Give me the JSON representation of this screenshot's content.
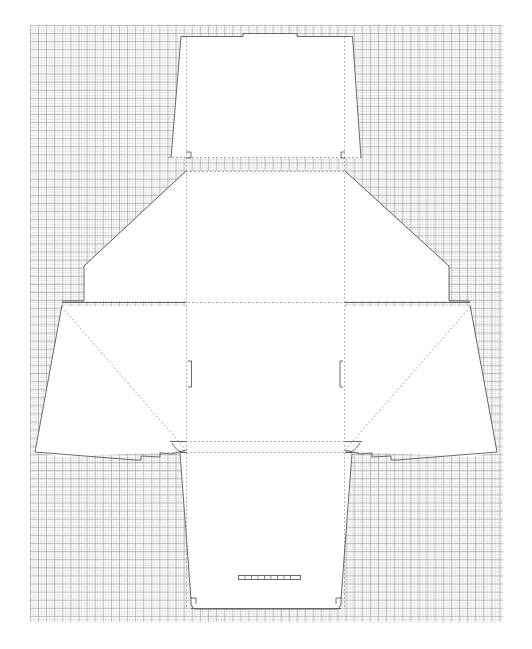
{
  "document": {
    "title": "Carton Dieline Template",
    "background": "graph-paper",
    "width": 532,
    "height": 649
  },
  "colors": {
    "paper_white": "#ffffff",
    "grid_major": "#96969b",
    "grid_minor": "#b9b9be",
    "cut_line": "#5a5a5a",
    "fold_line": "#8a8a8a",
    "fill": "#ffffff"
  },
  "grid": {
    "left": 30,
    "top": 25,
    "width": 473,
    "height": 597,
    "major_cell_px": 8.1,
    "minor_cell_px": 2.7
  },
  "line_styles": {
    "cut": {
      "name": "cut-line",
      "dash": "none",
      "width": 0.9
    },
    "fold": {
      "name": "fold-line",
      "dash": "1.6 2.4",
      "width": 0.9
    },
    "score": {
      "name": "score-line",
      "dash": "2 2",
      "width": 0.8
    }
  },
  "panels": [
    {
      "id": "top-tuck-flap",
      "label": "Top Tuck Flap",
      "outline": "M 171,157 L 181,36 L 243,36 L 243,33 L 297,33 L 297,36 L 352,36 L 360,157 Z"
    },
    {
      "id": "upper-left-wing",
      "label": "Upper Left Wing",
      "outline": "M 186,171 L 186,300 L 84,300 L 84,265 Z"
    },
    {
      "id": "upper-right-wing",
      "label": "Upper Right Wing",
      "outline": "M 345,171 L 345,300 L 449,300 L 449,265 Z"
    },
    {
      "id": "center-body-panel",
      "label": "Center Body Panel",
      "outline": "M 186,171 L 345,171 L 345,300 L 186,300 Z"
    },
    {
      "id": "lower-left-side-flap",
      "label": "Lower Left Side Flap",
      "outline": "M 186,306 L 186,449 L 62,456 L 35,452 L 62,306 Z"
    },
    {
      "id": "lower-right-side-flap",
      "label": "Lower Right Side Flap",
      "outline": "M 345,306 L 345,449 L 470,456 L 497,452 L 470,306 Z"
    },
    {
      "id": "bottom-panel",
      "label": "Bottom Panel",
      "outline": "M 180,456 L 351,456 L 340,609 L 192,609 Z"
    }
  ],
  "features": [
    {
      "id": "top-tab-notch",
      "label": "Top Tab Notch",
      "shape": "rect",
      "x": 243,
      "y": 33,
      "w": 54,
      "h": 3
    },
    {
      "id": "left-score-mark",
      "label": "Left Score Mark",
      "shape": "vline",
      "x": 191,
      "y": 361,
      "h": 26
    },
    {
      "id": "right-score-mark",
      "label": "Right Score Mark",
      "shape": "vline",
      "x": 341,
      "y": 361,
      "h": 26
    },
    {
      "id": "bottom-slot",
      "label": "Bottom Lock Slot",
      "shape": "slot",
      "x": 238,
      "y": 576,
      "w": 62,
      "h": 4
    },
    {
      "id": "left-tuck-curve",
      "label": "Left Tuck Curve",
      "shape": "arc"
    },
    {
      "id": "right-tuck-curve",
      "label": "Right Tuck Curve",
      "shape": "arc"
    }
  ],
  "fold_lines": [
    {
      "id": "fold-vertical-left",
      "label": "Left Vertical Fold",
      "from": [
        186,
        36
      ],
      "to": [
        186,
        609
      ]
    },
    {
      "id": "fold-vertical-right",
      "label": "Right Vertical Fold",
      "from": [
        345,
        36
      ],
      "to": [
        345,
        609
      ]
    },
    {
      "id": "fold-horizontal-upper",
      "label": "Upper Horizontal Fold",
      "from": [
        84,
        171
      ],
      "to": [
        449,
        171
      ]
    },
    {
      "id": "fold-horizontal-lower",
      "label": "Lower Horizontal Fold",
      "from": [
        35,
        303
      ],
      "to": [
        497,
        303
      ]
    },
    {
      "id": "fold-horizontal-bottom",
      "label": "Bottom Horizontal Fold",
      "from": [
        62,
        452
      ],
      "to": [
        470,
        452
      ]
    },
    {
      "id": "fold-diagonal-left",
      "label": "Left Diagonal Fold",
      "from": [
        62,
        306
      ],
      "to": [
        186,
        449
      ]
    },
    {
      "id": "fold-diagonal-right",
      "label": "Right Diagonal Fold",
      "from": [
        470,
        306
      ],
      "to": [
        345,
        449
      ]
    }
  ]
}
